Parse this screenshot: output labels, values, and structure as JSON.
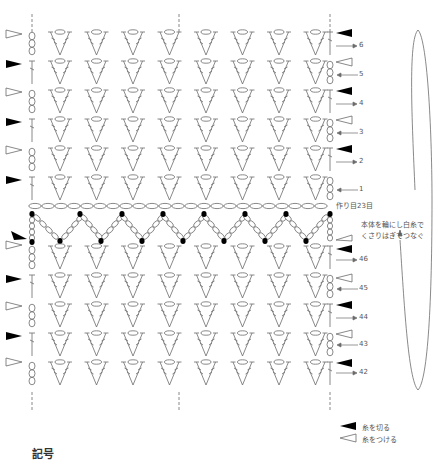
{
  "diagram": {
    "type": "crochet-stitch-chart",
    "stitch_columns": 8,
    "upper_rows": [
      {
        "row": 6,
        "side": "right",
        "arrow": "right",
        "left_marker": "join",
        "right_marker": "cut",
        "start": "chain"
      },
      {
        "row": 5,
        "side": "right",
        "arrow": "left",
        "left_marker": "cut",
        "right_marker": "join",
        "start": "stitch"
      },
      {
        "row": 4,
        "side": "right",
        "arrow": "right",
        "left_marker": "join",
        "right_marker": "cut",
        "start": "chain"
      },
      {
        "row": 3,
        "side": "right",
        "arrow": "left",
        "left_marker": "cut",
        "right_marker": "join",
        "start": "stitch"
      },
      {
        "row": 2,
        "side": "right",
        "arrow": "right",
        "left_marker": "join",
        "right_marker": "cut",
        "start": "chain"
      },
      {
        "row": 1,
        "side": "right",
        "arrow": "left",
        "left_marker": "cut",
        "right_marker": "none",
        "start": "stitch"
      }
    ],
    "lower_rows": [
      {
        "row": 46,
        "arrow": "right",
        "left_marker": "join",
        "right_marker": "cut"
      },
      {
        "row": 45,
        "arrow": "left",
        "left_marker": "cut",
        "right_marker": "join"
      },
      {
        "row": 44,
        "arrow": "right",
        "left_marker": "join",
        "right_marker": "cut"
      },
      {
        "row": 43,
        "arrow": "left",
        "left_marker": "cut",
        "right_marker": "join"
      },
      {
        "row": 42,
        "arrow": "right",
        "left_marker": "join",
        "right_marker": "cut"
      }
    ],
    "foundation_label": "作り目23目",
    "join_note_line1": "本体を輪にし白糸で",
    "join_note_line2": "くさりはぎでつなぐ",
    "row_labels": {
      "r6": "6",
      "r5": "5",
      "r4": "4",
      "r3": "3",
      "r2": "2",
      "r1": "1",
      "r46": "46",
      "r45": "45",
      "r44": "44",
      "r43": "43",
      "r42": "42"
    },
    "colors": {
      "line": "#6b6b6b",
      "filled_marker": "#000000",
      "text": "#555555"
    }
  },
  "legend": {
    "cut_yarn": {
      "icon": "filled-triangle-icon",
      "label": "糸を切る"
    },
    "join_yarn": {
      "icon": "outline-triangle-icon",
      "label": "糸をつける"
    }
  },
  "footer": {
    "cut_heading": "記号"
  }
}
